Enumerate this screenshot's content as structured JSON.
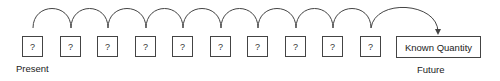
{
  "diagram": {
    "unknown_boxes": [
      {
        "label": "?"
      },
      {
        "label": "?"
      },
      {
        "label": "?"
      },
      {
        "label": "?"
      },
      {
        "label": "?"
      },
      {
        "label": "?"
      },
      {
        "label": "?"
      },
      {
        "label": "?"
      },
      {
        "label": "?"
      },
      {
        "label": "?"
      }
    ],
    "known_box": {
      "label": "Known Quantity"
    },
    "start_label": "Present",
    "end_label": "Future",
    "line_color": "#444444"
  }
}
